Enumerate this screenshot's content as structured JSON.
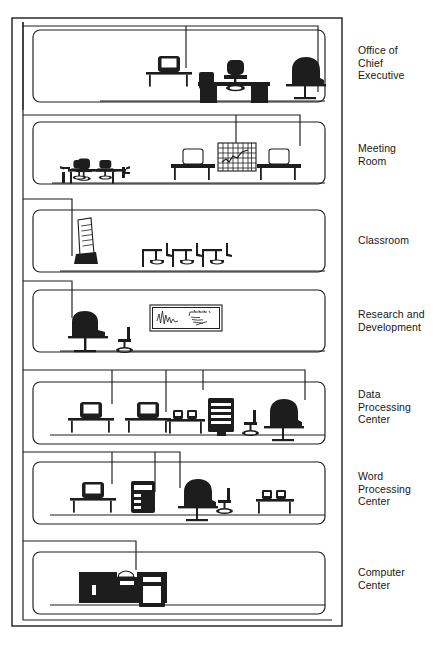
{
  "figure": {
    "type": "building-cutaway-network-diagram",
    "ink_color": "#1d1d1d",
    "paper_color": "#ffffff"
  },
  "labels": {
    "room_labels": [
      {
        "id": "office-of-chief-executive",
        "text": "Office of\nChief\nExecutive",
        "top": 44
      },
      {
        "id": "meeting-room",
        "text": "Meeting\nRoom",
        "top": 142
      },
      {
        "id": "classroom",
        "text": "Classroom",
        "top": 234
      },
      {
        "id": "research-and-development",
        "text": "Research and\nDevelopment",
        "top": 308
      },
      {
        "id": "data-processing-center",
        "text": "Data\nProcessing\nCenter",
        "top": 388
      },
      {
        "id": "word-processing-center",
        "text": "Word\nProcessing\nCenter",
        "top": 470
      },
      {
        "id": "computer-center",
        "text": "Computer\nCenter",
        "top": 566
      }
    ]
  },
  "caption": {
    "text": ""
  },
  "rooms": [
    {
      "id": "office-of-chief-executive",
      "name": "Office of Chief Executive",
      "order": 1,
      "box": {
        "x": 33,
        "y": 30,
        "w": 292,
        "h": 72
      },
      "furniture": [
        "computer-terminal-on-desk",
        "executive-desk-with-pedestals",
        "swivel-executive-chair",
        "wing-armchair-on-stand"
      ],
      "riser_drop_x": 186
    },
    {
      "id": "meeting-room",
      "name": "Meeting Room",
      "order": 2,
      "box": {
        "x": 33,
        "y": 120,
        "w": 292,
        "h": 62
      },
      "furniture": [
        "conference-table-with-chairs",
        "computer-terminal-on-desk",
        "wall-chart-grid",
        "computer-terminal-on-desk"
      ],
      "riser_drop_x": 236
    },
    {
      "id": "classroom",
      "name": "Classroom",
      "order": 3,
      "box": {
        "x": 33,
        "y": 208,
        "w": 292,
        "h": 62
      },
      "furniture": [
        "flip-chart-easel",
        "student-desk-and-chair",
        "student-desk-and-chair",
        "student-desk-and-chair"
      ],
      "riser_drop_x": 73
    },
    {
      "id": "research-and-development",
      "name": "Research and Development",
      "order": 4,
      "box": {
        "x": 33,
        "y": 288,
        "w": 292,
        "h": 62
      },
      "furniture": [
        "high-back-chair-on-pedestal",
        "small-task-chair",
        "whiteboard-with-waveform-and-equations"
      ],
      "riser_drop_x": 73
    },
    {
      "id": "data-processing-center",
      "name": "Data Processing Center",
      "order": 5,
      "box": {
        "x": 33,
        "y": 378,
        "w": 292,
        "h": 62
      },
      "furniture": [
        "terminal-workstation",
        "terminal-workstation",
        "twin-desktop-units-on-table",
        "rack-tower-unit",
        "small-task-chair",
        "wing-armchair-on-stand"
      ],
      "riser_drop_x": 112
    },
    {
      "id": "word-processing-center",
      "name": "Word Processing Center",
      "order": 6,
      "box": {
        "x": 33,
        "y": 458,
        "w": 292,
        "h": 62
      },
      "furniture": [
        "terminal-workstation",
        "printer-tower-unit",
        "wing-armchair-on-stand",
        "small-task-chair",
        "twin-desktop-units-on-table"
      ],
      "riser_drop_x": 112
    },
    {
      "id": "computer-center",
      "name": "Computer Center",
      "order": 7,
      "box": {
        "x": 33,
        "y": 550,
        "w": 292,
        "h": 62
      },
      "furniture": [
        "mainframe-cabinets",
        "tape-drive-unit",
        "disk-storage-unit"
      ],
      "riser_drop_x": 136
    }
  ],
  "cabling": {
    "description": "Riser and horizontal distribution cable runs linking each floor's equipment",
    "vertical_spine_x": 26,
    "outer_frame": {
      "x": 12,
      "y": 18,
      "w": 330,
      "h": 608
    }
  }
}
